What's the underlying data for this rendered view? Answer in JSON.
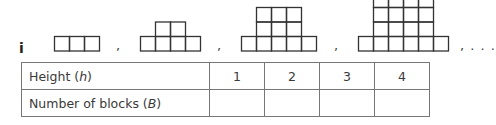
{
  "part_label": "i",
  "separators": [
    ",",
    ",",
    ",",
    ", . . ."
  ],
  "patterns": [
    {
      "height": 1,
      "rows": [
        3
      ]
    },
    {
      "height": 2,
      "rows": [
        4,
        2
      ]
    },
    {
      "height": 3,
      "rows": [
        5,
        3,
        3
      ]
    },
    {
      "height": 4,
      "rows": [
        6,
        4,
        4,
        4
      ]
    }
  ],
  "table": {
    "rows": [
      {
        "label_prefix": "Height (",
        "label_var": "h",
        "label_suffix": ")",
        "cells": [
          "1",
          "2",
          "3",
          "4"
        ]
      },
      {
        "label_prefix": "Number of blocks (",
        "label_var": "B",
        "label_suffix": ")",
        "cells": [
          "",
          "",
          "",
          ""
        ]
      }
    ]
  },
  "colors": {
    "block_stroke": "#333333",
    "table_border": "#777777",
    "text": "#3a3a3a"
  }
}
